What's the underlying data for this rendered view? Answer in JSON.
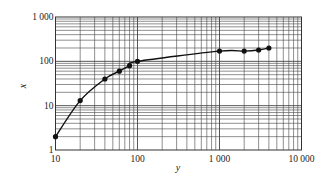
{
  "chart_data": {
    "type": "line",
    "title": "",
    "xlabel": "y",
    "ylabel": "x",
    "xscale": "log",
    "yscale": "log",
    "xlim": [
      10,
      10000
    ],
    "ylim": [
      1,
      1000
    ],
    "grid": true,
    "legend": null,
    "x_tick_labels": [
      "10",
      "100",
      "1 000",
      "10 000"
    ],
    "y_tick_labels": [
      "1",
      "10",
      "100",
      "1 000"
    ],
    "series": [
      {
        "name": "curve",
        "marker": "filled-circle",
        "x": [
          10,
          20,
          40,
          60,
          80,
          100,
          1000,
          2000,
          3000,
          4000
        ],
        "y": [
          2,
          13,
          40,
          60,
          80,
          100,
          170,
          170,
          180,
          200
        ]
      }
    ]
  },
  "colors": {
    "line": "#111111",
    "grid": "#444444",
    "background": "#ffffff"
  }
}
